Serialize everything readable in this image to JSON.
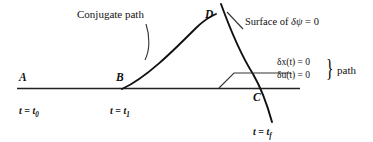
{
  "figure": {
    "background_color": "#ffffff",
    "ink_color": "#111111",
    "labels": {
      "conjugate_path": "Conjugate path",
      "surface_of": "Surface of",
      "surface_expr_delta": "δ",
      "surface_expr_psi": "ψ",
      "surface_expr_eq": "= 0",
      "point_a": "A",
      "point_b": "B",
      "point_c": "C",
      "point_d": "D",
      "time_t0_lhs": "t",
      "time_t0_eq": "=",
      "time_t0_rhs": "t",
      "time_t0_sub": "0",
      "time_t1_sub": "1",
      "time_tf_sub": "f",
      "delta_x_expr": "δx(t) = 0",
      "delta_u_expr": "δu(t) = 0",
      "brace_glyph": "}",
      "path_word": "path"
    }
  }
}
